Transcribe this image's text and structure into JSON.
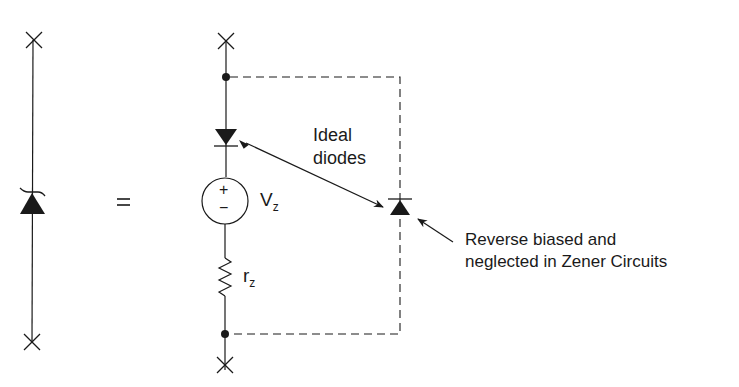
{
  "diagram": {
    "type": "zener-diode-equivalent-circuit",
    "equals_sign": "=",
    "labels": {
      "ideal_diodes_line1": "Ideal",
      "ideal_diodes_line2": "diodes",
      "vz_main": "V",
      "vz_sub": "z",
      "rz_main": "r",
      "rz_sub": "z",
      "source_plus": "+",
      "source_minus": "−",
      "note_line1": "Reverse biased and",
      "note_line2": "neglected in Zener Circuits"
    },
    "components": [
      {
        "id": "zener-diode",
        "symbol": "zener"
      },
      {
        "id": "ideal-diode-forward",
        "symbol": "diode"
      },
      {
        "id": "voltage-source",
        "symbol": "dc-source",
        "label": "Vz"
      },
      {
        "id": "resistor",
        "symbol": "resistor",
        "label": "rz"
      },
      {
        "id": "ideal-diode-reverse",
        "symbol": "diode",
        "note": "Reverse biased and neglected in Zener Circuits"
      }
    ],
    "colors": {
      "ink": "#1a1a1a",
      "background": "#ffffff"
    }
  }
}
